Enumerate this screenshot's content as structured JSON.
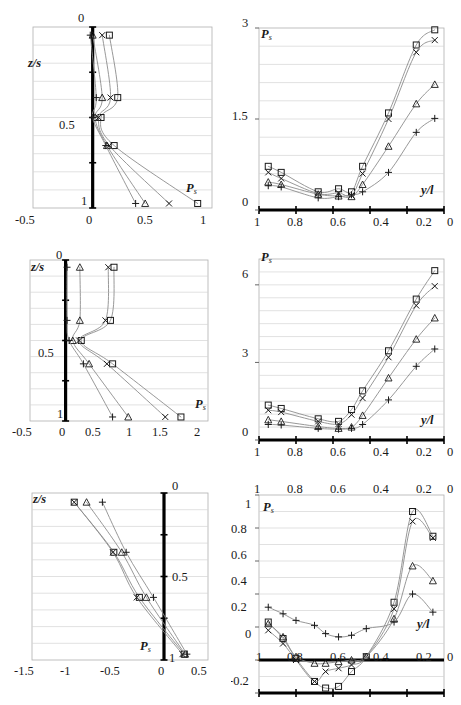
{
  "figure": {
    "panel_count": 6,
    "marker_series": [
      "square",
      "cross",
      "triangle",
      "plus"
    ],
    "line_color": "#8c8c8c",
    "marker_color": "#1a1a1a",
    "axis_color": "#000000",
    "grid_color": "#d4d4d4",
    "frame_color": "#b0b0b0"
  },
  "panels": [
    {
      "id": "top-left",
      "axis_label_x": "P",
      "axis_label_x_sub": "s",
      "axis_label_y": "z/s",
      "x_ticks": [
        "-0.5",
        "0",
        "0.5",
        "1"
      ],
      "x_tick_values": [
        -0.5,
        0,
        0.5,
        1
      ],
      "y_ticks": [
        "0",
        "0.5",
        "1"
      ],
      "y_tick_values": [
        0,
        0.5,
        1
      ],
      "xlim": [
        -0.5,
        1
      ],
      "ylim": [
        0,
        1
      ],
      "grid_rows": 10,
      "vertical_axis_at": 0
    },
    {
      "id": "top-right",
      "axis_label_x": "y/l",
      "axis_label_y": "P",
      "axis_label_y_sub": "s",
      "x_ticks": [
        "1",
        "0.8",
        "0.6",
        "0.4",
        "0.2",
        "0"
      ],
      "x_tick_values": [
        1,
        0.8,
        0.6,
        0.4,
        0.2,
        0
      ],
      "y_ticks": [
        "0",
        "1.5",
        "3"
      ],
      "y_tick_values": [
        0,
        1.5,
        3
      ],
      "xlim": [
        1,
        0
      ],
      "ylim": [
        0,
        3
      ],
      "grid_rows": 10
    },
    {
      "id": "mid-left",
      "axis_label_x": "P",
      "axis_label_x_sub": "s",
      "axis_label_y": "z/s",
      "x_ticks": [
        "-0.5",
        "0",
        "0.5",
        "1",
        "1.5",
        "2"
      ],
      "x_tick_values": [
        -0.5,
        0,
        0.5,
        1,
        1.5,
        2
      ],
      "y_ticks": [
        "0",
        "0.5",
        "1"
      ],
      "y_tick_values": [
        0,
        0.5,
        1
      ],
      "xlim": [
        -0.5,
        2
      ],
      "ylim": [
        0,
        1
      ],
      "grid_rows": 10,
      "vertical_axis_at": 0
    },
    {
      "id": "mid-right",
      "axis_label_x": "y/l",
      "axis_label_y": "P",
      "axis_label_y_sub": "s",
      "x_ticks": [
        "1",
        "0.8",
        "0.6",
        "0.4",
        "0.2",
        "0"
      ],
      "x_tick_values": [
        1,
        0.8,
        0.6,
        0.4,
        0.2,
        0
      ],
      "y_ticks": [
        "0",
        "3",
        "6"
      ],
      "y_tick_values": [
        0,
        3,
        6
      ],
      "xlim": [
        1,
        0
      ],
      "ylim": [
        0,
        7
      ],
      "grid_rows": 14
    },
    {
      "id": "bottom-left",
      "axis_label_x": "P",
      "axis_label_x_sub": "s",
      "axis_label_y": "z/s",
      "x_ticks": [
        "-1.5",
        "-1",
        "-0.5",
        "0",
        "0.5"
      ],
      "x_tick_values": [
        -1.5,
        -1,
        -0.5,
        0,
        0.5
      ],
      "y_ticks": [
        "0",
        "0.5",
        "1"
      ],
      "y_tick_values": [
        0,
        0.5,
        1
      ],
      "xlim": [
        -1.5,
        0.5
      ],
      "ylim": [
        0,
        1
      ],
      "grid_rows": 10,
      "vertical_axis_at": 0
    },
    {
      "id": "bottom-right",
      "axis_label_x": "y/l",
      "axis_label_y": "P",
      "axis_label_y_sub": "s",
      "x_ticks": [
        "1",
        "0.8",
        "0.6",
        "0.4",
        "0.2",
        "0"
      ],
      "x_tick_values": [
        1,
        0.8,
        0.6,
        0.4,
        0.2,
        0
      ],
      "y_ticks": [
        "1",
        "0.8",
        "0.6",
        "0.4",
        "0.2",
        "0",
        "-0.2"
      ],
      "y_tick_values": [
        1,
        0.8,
        0.6,
        0.4,
        0.2,
        0,
        -0.2
      ],
      "xlim": [
        1,
        0
      ],
      "ylim": [
        -0.2,
        1
      ],
      "grid_rows": 12
    }
  ],
  "chart_data": [
    {
      "id": "top-left",
      "type": "line",
      "title": "",
      "xlabel": "P_s",
      "ylabel": "z/s",
      "xlim": [
        -0.5,
        1
      ],
      "ylim": [
        0,
        1
      ],
      "grid": true,
      "legend": "none",
      "orientation": "x-is-Ps, y-is-z/s (y inverted, 0 at top)",
      "series": [
        {
          "name": "square",
          "marker": "square",
          "x": [
            0.14,
            0.21,
            0.07,
            0.18,
            0.88
          ],
          "y": [
            0.045,
            0.39,
            0.5,
            0.655,
            0.975
          ]
        },
        {
          "name": "cross",
          "marker": "cross",
          "x": [
            0.08,
            0.15,
            0.05,
            0.14,
            0.64
          ],
          "y": [
            0.045,
            0.39,
            0.5,
            0.655,
            0.975
          ]
        },
        {
          "name": "triangle",
          "marker": "triangle",
          "x": [
            0.0,
            0.08,
            0.02,
            0.12,
            0.44
          ],
          "y": [
            0.045,
            0.39,
            0.5,
            0.655,
            0.975
          ]
        },
        {
          "name": "plus",
          "marker": "plus",
          "x": [
            -0.02,
            0.03,
            0.0,
            0.11,
            0.36
          ],
          "y": [
            0.045,
            0.39,
            0.5,
            0.655,
            0.975
          ]
        }
      ]
    },
    {
      "id": "top-right",
      "type": "line",
      "title": "",
      "xlabel": "y/l",
      "ylabel": "P_s",
      "xlim": [
        1,
        0
      ],
      "ylim": [
        0,
        3
      ],
      "grid": true,
      "legend": "none",
      "series": [
        {
          "name": "square",
          "marker": "square",
          "x": [
            0.95,
            0.88,
            0.68,
            0.57,
            0.5,
            0.44,
            0.3,
            0.15,
            0.05
          ],
          "y": [
            0.72,
            0.62,
            0.3,
            0.35,
            0.3,
            0.72,
            1.6,
            2.72,
            2.97
          ]
        },
        {
          "name": "cross",
          "marker": "cross",
          "x": [
            0.95,
            0.88,
            0.68,
            0.57,
            0.5,
            0.44,
            0.3,
            0.15,
            0.05
          ],
          "y": [
            0.62,
            0.52,
            0.27,
            0.28,
            0.24,
            0.6,
            1.5,
            2.6,
            2.8
          ]
        },
        {
          "name": "triangle",
          "marker": "triangle",
          "x": [
            0.95,
            0.88,
            0.68,
            0.57,
            0.5,
            0.44,
            0.3,
            0.15,
            0.05
          ],
          "y": [
            0.46,
            0.42,
            0.26,
            0.23,
            0.22,
            0.42,
            1.05,
            1.75,
            2.07
          ]
        },
        {
          "name": "plus",
          "marker": "plus",
          "x": [
            0.95,
            0.88,
            0.68,
            0.57,
            0.5,
            0.44,
            0.3,
            0.15,
            0.05
          ],
          "y": [
            0.4,
            0.38,
            0.2,
            0.22,
            0.25,
            0.3,
            0.62,
            1.28,
            1.51
          ]
        }
      ]
    },
    {
      "id": "mid-left",
      "type": "line",
      "title": "",
      "xlabel": "P_s",
      "ylabel": "z/s",
      "xlim": [
        -0.5,
        2
      ],
      "ylim": [
        0,
        1
      ],
      "grid": true,
      "legend": "none",
      "orientation": "x-is-Ps, y-is-z/s (y inverted, 0 at top)",
      "series": [
        {
          "name": "square",
          "marker": "square",
          "x": [
            0.68,
            0.63,
            0.22,
            0.66,
            1.62
          ],
          "y": [
            0.045,
            0.375,
            0.5,
            0.645,
            0.975
          ]
        },
        {
          "name": "cross",
          "marker": "cross",
          "x": [
            0.6,
            0.56,
            0.19,
            0.58,
            1.4
          ],
          "y": [
            0.045,
            0.375,
            0.5,
            0.645,
            0.975
          ]
        },
        {
          "name": "triangle",
          "marker": "triangle",
          "x": [
            0.2,
            0.2,
            0.1,
            0.33,
            0.88
          ],
          "y": [
            0.045,
            0.375,
            0.5,
            0.645,
            0.975
          ]
        },
        {
          "name": "plus",
          "marker": "plus",
          "x": [
            0.02,
            0.02,
            0.05,
            0.25,
            0.66
          ],
          "y": [
            0.045,
            0.375,
            0.5,
            0.645,
            0.975
          ]
        }
      ]
    },
    {
      "id": "mid-right",
      "type": "line",
      "title": "",
      "xlabel": "y/l",
      "ylabel": "P_s",
      "xlim": [
        1,
        0
      ],
      "ylim": [
        0,
        7
      ],
      "grid": true,
      "legend": "none",
      "series": [
        {
          "name": "square",
          "marker": "square",
          "x": [
            0.95,
            0.88,
            0.68,
            0.57,
            0.5,
            0.44,
            0.3,
            0.15,
            0.05
          ],
          "y": [
            1.35,
            1.22,
            0.82,
            0.72,
            1.18,
            1.9,
            3.45,
            5.45,
            6.55
          ]
        },
        {
          "name": "cross",
          "marker": "cross",
          "x": [
            0.95,
            0.88,
            0.68,
            0.57,
            0.5,
            0.44,
            0.3,
            0.15,
            0.05
          ],
          "y": [
            1.15,
            1.08,
            0.72,
            0.62,
            0.98,
            1.62,
            3.2,
            5.2,
            5.95
          ]
        },
        {
          "name": "triangle",
          "marker": "triangle",
          "x": [
            0.95,
            0.88,
            0.68,
            0.57,
            0.5,
            0.44,
            0.3,
            0.15,
            0.05
          ],
          "y": [
            0.78,
            0.72,
            0.52,
            0.45,
            0.5,
            0.95,
            2.4,
            3.9,
            4.72
          ]
        },
        {
          "name": "plus",
          "marker": "plus",
          "x": [
            0.95,
            0.88,
            0.68,
            0.57,
            0.5,
            0.44,
            0.3,
            0.15,
            0.05
          ],
          "y": [
            0.6,
            0.58,
            0.45,
            0.42,
            0.45,
            0.6,
            1.55,
            2.85,
            3.52
          ]
        }
      ]
    },
    {
      "id": "bottom-left",
      "type": "line",
      "title": "",
      "xlabel": "P_s",
      "ylabel": "z/s",
      "xlim": [
        -1.5,
        0.5
      ],
      "ylim": [
        0,
        1
      ],
      "grid": true,
      "legend": "none",
      "orientation": "x-is-Ps, y-is-z/s (y inverted, 0 at top)",
      "series": [
        {
          "name": "square",
          "marker": "square",
          "x": [
            -1.02,
            -0.57,
            -0.28,
            0.23
          ],
          "y": [
            0.055,
            0.355,
            0.625,
            0.965
          ]
        },
        {
          "name": "cross",
          "marker": "cross",
          "x": [
            -1.02,
            -0.58,
            -0.31,
            0.21
          ],
          "y": [
            0.055,
            0.355,
            0.625,
            0.965
          ]
        },
        {
          "name": "triangle",
          "marker": "triangle",
          "x": [
            -0.88,
            -0.48,
            -0.2,
            0.24
          ],
          "y": [
            0.055,
            0.355,
            0.625,
            0.965
          ]
        },
        {
          "name": "plus",
          "marker": "plus",
          "x": [
            -0.7,
            -0.43,
            -0.12,
            0.26
          ],
          "y": [
            0.055,
            0.355,
            0.625,
            0.965
          ]
        }
      ]
    },
    {
      "id": "bottom-right",
      "type": "line",
      "title": "",
      "xlabel": "y/l",
      "ylabel": "P_s",
      "xlim": [
        1,
        0
      ],
      "ylim": [
        -0.2,
        1
      ],
      "grid": true,
      "legend": "none",
      "series": [
        {
          "name": "square",
          "marker": "square",
          "x": [
            0.95,
            0.87,
            0.8,
            0.7,
            0.64,
            0.57,
            0.5,
            0.42,
            0.27,
            0.17,
            0.06
          ],
          "y": [
            0.23,
            0.13,
            0.01,
            -0.13,
            -0.17,
            -0.16,
            -0.07,
            0.02,
            0.35,
            0.9,
            0.75
          ]
        },
        {
          "name": "cross",
          "marker": "cross",
          "x": [
            0.95,
            0.87,
            0.8,
            0.7,
            0.64,
            0.57,
            0.5,
            0.42,
            0.27,
            0.17,
            0.06
          ],
          "y": [
            0.18,
            0.1,
            0.0,
            -0.13,
            -0.07,
            -0.05,
            -0.03,
            0.02,
            0.31,
            0.84,
            0.74
          ]
        },
        {
          "name": "triangle",
          "marker": "triangle",
          "x": [
            0.95,
            0.87,
            0.8,
            0.7,
            0.64,
            0.57,
            0.5,
            0.42,
            0.27,
            0.17,
            0.06
          ],
          "y": [
            0.22,
            0.14,
            0.02,
            -0.02,
            -0.02,
            -0.01,
            0.0,
            0.02,
            0.25,
            0.57,
            0.48
          ]
        },
        {
          "name": "plus",
          "marker": "plus",
          "x": [
            0.95,
            0.87,
            0.8,
            0.7,
            0.64,
            0.57,
            0.5,
            0.42,
            0.27,
            0.17,
            0.06
          ],
          "y": [
            0.32,
            0.28,
            0.24,
            0.21,
            0.16,
            0.14,
            0.15,
            0.19,
            0.23,
            0.4,
            0.29
          ]
        }
      ]
    }
  ]
}
